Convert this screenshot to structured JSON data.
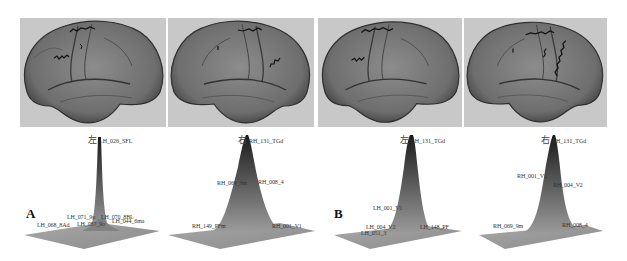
{
  "figure": {
    "panels": [
      {
        "letter": "A",
        "brains": [
          {
            "hemisphere": "left",
            "view": "lateral"
          },
          {
            "hemisphere": "right",
            "view": "lateral"
          }
        ],
        "plots": [
          {
            "hemi_label": "左",
            "peak_label": "LH_026_SFL",
            "labels": [
              "LH_071_9p",
              "LH_070_8BL",
              "LH_068_8Ad",
              "LH_087_9a",
              "LH_044_6ma"
            ]
          },
          {
            "hemi_label": "右",
            "peak_label": "RH_131_TGd",
            "labels": [
              "RH_069_9m",
              "RH_008_4",
              "RH_149_PFm",
              "RH_001_V1"
            ]
          }
        ]
      },
      {
        "letter": "B",
        "brains": [
          {
            "hemisphere": "left",
            "view": "lateral"
          },
          {
            "hemisphere": "right",
            "view": "lateral"
          }
        ],
        "plots": [
          {
            "hemi_label": "左",
            "peak_label": "LH_131_TGd",
            "labels": [
              "LH_001_V1",
              "LH_004_V2",
              "LH_148_PF",
              "LH_051_3"
            ]
          },
          {
            "hemi_label": "右",
            "peak_label": "RH_131_TGd",
            "labels": [
              "RH_001_V1",
              "RH_004_V2",
              "RH_069_9m",
              "RH_008_4"
            ]
          }
        ]
      }
    ],
    "colors": {
      "brain_bg": "#c8c8c8",
      "brain_surface": "#7a7a7a",
      "sulcus": "#3a3a3a",
      "plane": "#9a9a9a",
      "peak_dark": "#222222"
    }
  }
}
